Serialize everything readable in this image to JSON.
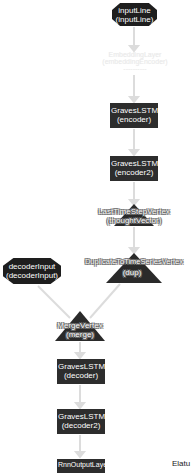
{
  "diagram": {
    "nodes": [
      {
        "id": "inputLine",
        "type": "input",
        "shape": "octagon",
        "line1": "inputLine",
        "line2": "(inputLine)"
      },
      {
        "id": "embedding",
        "type": "layer",
        "shape": "box",
        "faded": true,
        "line1": "EmbeddingLayer",
        "line2": "(embeddingEncoder)",
        "line3": "----------"
      },
      {
        "id": "encoder",
        "type": "layer",
        "shape": "box",
        "line1": "GravesLSTM",
        "line2": "(encoder)"
      },
      {
        "id": "encoder2",
        "type": "layer",
        "shape": "box",
        "line1": "GravesLSTM",
        "line2": "(encoder2)"
      },
      {
        "id": "thoughtVector",
        "type": "vertex",
        "shape": "triangle",
        "line1": "LastTimeStepVertex",
        "line2": "(thoughtVector)"
      },
      {
        "id": "decoderInput",
        "type": "input",
        "shape": "octagon",
        "line1": "decoderInput",
        "line2": "(decoderInput)"
      },
      {
        "id": "dup",
        "type": "vertex",
        "shape": "triangle",
        "line1": "DuplicateToTimeSeriesVertex",
        "line2": "(dup)"
      },
      {
        "id": "merge",
        "type": "vertex",
        "shape": "triangle",
        "line1": "MergeVertex",
        "line2": "(merge)"
      },
      {
        "id": "decoder",
        "type": "layer",
        "shape": "box",
        "line1": "GravesLSTM",
        "line2": "(decoder)"
      },
      {
        "id": "decoder2",
        "type": "layer",
        "shape": "box",
        "line1": "GravesLSTM",
        "line2": "(decoder2)"
      },
      {
        "id": "output",
        "type": "layer",
        "shape": "box",
        "line1": "RnnOutputLayer",
        "line2": ""
      }
    ],
    "edges": [
      [
        "inputLine",
        "embedding"
      ],
      [
        "embedding",
        "encoder"
      ],
      [
        "encoder",
        "encoder2"
      ],
      [
        "encoder2",
        "thoughtVector"
      ],
      [
        "thoughtVector",
        "dup"
      ],
      [
        "dup",
        "merge"
      ],
      [
        "decoderInput",
        "merge"
      ],
      [
        "merge",
        "decoder"
      ],
      [
        "decoder",
        "decoder2"
      ],
      [
        "decoder2",
        "output"
      ]
    ],
    "colors": {
      "node": "#2d2d2d",
      "edge": "#dcdcdc",
      "faded": "#eeeeee"
    }
  },
  "status_text": "Elatu"
}
